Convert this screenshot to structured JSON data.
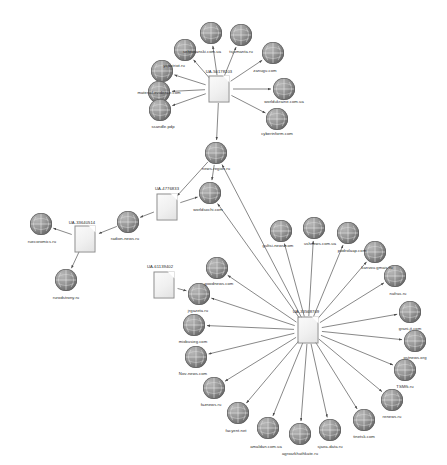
{
  "diagram": {
    "type": "link-analysis-graph",
    "background": "#ffffff",
    "edge_color": "#555555",
    "node_types": {
      "document": "ua-tracking-id-document-icon",
      "globe": "website-globe-icon"
    },
    "nodes": [
      {
        "id": "ua_top",
        "kind": "document",
        "label": "UA-50178103",
        "x": 219,
        "y": 89,
        "label_x": 219,
        "label_y": 69
      },
      {
        "id": "sehrosanski",
        "kind": "globe",
        "label": "sehrosanski.com.ua",
        "x": 185,
        "y": 50,
        "label_x": 202,
        "label_y": 49
      },
      {
        "id": "tsjumanta",
        "kind": "globe",
        "label": "tsjumanta.ru",
        "x": 241,
        "y": 35,
        "label_x": 241,
        "label_y": 49
      },
      {
        "id": "top_unlabeled",
        "kind": "globe",
        "label": "",
        "x": 211,
        "y": 33,
        "label_x": 211,
        "label_y": 24
      },
      {
        "id": "yapatriot",
        "kind": "globe",
        "label": "yapatriot.ru",
        "x": 162,
        "y": 71,
        "label_x": 174,
        "label_y": 63
      },
      {
        "id": "zanugu",
        "kind": "globe",
        "label": "zanugu.com",
        "x": 273,
        "y": 53,
        "label_x": 265,
        "label_y": 68
      },
      {
        "id": "material_ev",
        "kind": "globe",
        "label": "material-evidence.com",
        "x": 159,
        "y": 92,
        "label_x": 159,
        "label_y": 90
      },
      {
        "id": "worldukraine",
        "kind": "globe",
        "label": "worldukraine.com.ua",
        "x": 284,
        "y": 89,
        "label_x": 284,
        "label_y": 99
      },
      {
        "id": "ssandle",
        "kind": "globe",
        "label": "ssandle.pdp",
        "x": 160,
        "y": 110,
        "label_x": 163,
        "label_y": 124
      },
      {
        "id": "cyberinform",
        "kind": "globe",
        "label": "cyberinform.com",
        "x": 277,
        "y": 119,
        "label_x": 277,
        "label_y": 131
      },
      {
        "id": "news_region",
        "kind": "globe",
        "label": "news-region.ru",
        "x": 216,
        "y": 153,
        "label_x": 216,
        "label_y": 166
      },
      {
        "id": "ua_4776833",
        "kind": "document",
        "label": "UA-4776833",
        "x": 167,
        "y": 207,
        "label_x": 167,
        "label_y": 186
      },
      {
        "id": "worldsochi",
        "kind": "globe",
        "label": "worldsochi.com",
        "x": 210,
        "y": 193,
        "label_x": 208,
        "label_y": 207
      },
      {
        "id": "radion_news",
        "kind": "globe",
        "label": "radion-news.ru",
        "x": 128,
        "y": 222,
        "label_x": 125,
        "label_y": 236
      },
      {
        "id": "ua_33640514",
        "kind": "document",
        "label": "UA-33640514",
        "x": 85,
        "y": 239,
        "label_x": 82,
        "label_y": 220
      },
      {
        "id": "ruecoromics",
        "kind": "globe",
        "label": "ruecoromics.ru",
        "x": 41,
        "y": 224,
        "label_x": 42,
        "label_y": 239
      },
      {
        "id": "rurodstrony",
        "kind": "globe",
        "label": "rurodstrony.ru",
        "x": 66,
        "y": 280,
        "label_x": 66,
        "label_y": 295
      },
      {
        "id": "ua_61139402",
        "kind": "document",
        "label": "UA-61139402",
        "x": 164,
        "y": 285,
        "label_x": 160,
        "label_y": 264
      },
      {
        "id": "ua_hub",
        "kind": "document",
        "label": "UA-33568709",
        "x": 308,
        "y": 330,
        "label_x": 306,
        "label_y": 309
      },
      {
        "id": "gultsi",
        "kind": "globe",
        "label": "gultsi-news.com",
        "x": 281,
        "y": 231,
        "label_x": 278,
        "label_y": 243
      },
      {
        "id": "ushnews",
        "kind": "globe",
        "label": "ushnews.com.ua",
        "x": 314,
        "y": 228,
        "label_x": 320,
        "label_y": 241
      },
      {
        "id": "podrolaap",
        "kind": "globe",
        "label": "podrolaap.com",
        "x": 348,
        "y": 233,
        "label_x": 352,
        "label_y": 248
      },
      {
        "id": "kanvou",
        "kind": "globe",
        "label": "kanvou.gmais.ru",
        "x": 375,
        "y": 252,
        "label_x": 377,
        "label_y": 265
      },
      {
        "id": "nafras",
        "kind": "globe",
        "label": "nafras.ru",
        "x": 395,
        "y": 276,
        "label_x": 398,
        "label_y": 291
      },
      {
        "id": "granit",
        "kind": "globe",
        "label": "grani-jt.com",
        "x": 410,
        "y": 312,
        "label_x": 410,
        "label_y": 326
      },
      {
        "id": "ostnews",
        "kind": "globe",
        "label": "ostnews.org",
        "x": 415,
        "y": 341,
        "label_x": 415,
        "label_y": 355
      },
      {
        "id": "tsmfk",
        "kind": "globe",
        "label": "TSMfk.ru",
        "x": 405,
        "y": 370,
        "label_x": 405,
        "label_y": 384
      },
      {
        "id": "renews",
        "kind": "globe",
        "label": "renews.ru",
        "x": 392,
        "y": 400,
        "label_x": 392,
        "label_y": 414
      },
      {
        "id": "tinetsk",
        "kind": "globe",
        "label": "tinetsk.com",
        "x": 364,
        "y": 420,
        "label_x": 364,
        "label_y": 434
      },
      {
        "id": "sjaea_data",
        "kind": "globe",
        "label": "sjaea-data.ru",
        "x": 330,
        "y": 430,
        "label_x": 330,
        "label_y": 444
      },
      {
        "id": "agromarkt",
        "kind": "globe",
        "label": "agroarkhathkate.ru",
        "x": 300,
        "y": 434,
        "label_x": 300,
        "label_y": 451
      },
      {
        "id": "amaldan",
        "kind": "globe",
        "label": "amaldan.com.ua",
        "x": 268,
        "y": 428,
        "label_x": 266,
        "label_y": 444
      },
      {
        "id": "facyent",
        "kind": "globe",
        "label": "facyent.net",
        "x": 238,
        "y": 413,
        "label_x": 236,
        "label_y": 428
      },
      {
        "id": "faznews",
        "kind": "globe",
        "label": "faznews.ru",
        "x": 214,
        "y": 388,
        "label_x": 211,
        "label_y": 402
      },
      {
        "id": "nov_news",
        "kind": "globe",
        "label": "Nov-news.com",
        "x": 196,
        "y": 357,
        "label_x": 193,
        "label_y": 371
      },
      {
        "id": "mixbusieg",
        "kind": "globe",
        "label": "mixbusieg.com",
        "x": 194,
        "y": 325,
        "label_x": 193,
        "label_y": 339
      },
      {
        "id": "jrgazeta",
        "kind": "globe",
        "label": "jrgazeta.ru",
        "x": 199,
        "y": 294,
        "label_x": 198,
        "label_y": 308
      },
      {
        "id": "goodnews",
        "kind": "globe",
        "label": "goodnews.com",
        "x": 217,
        "y": 268,
        "label_x": 219,
        "label_y": 281
      }
    ],
    "edges": [
      {
        "from": "ua_top",
        "to": "top_unlabeled"
      },
      {
        "from": "ua_top",
        "to": "sehrosanski"
      },
      {
        "from": "ua_top",
        "to": "tsjumanta"
      },
      {
        "from": "ua_top",
        "to": "yapatriot"
      },
      {
        "from": "ua_top",
        "to": "zanugu"
      },
      {
        "from": "ua_top",
        "to": "material_ev"
      },
      {
        "from": "ua_top",
        "to": "worldukraine"
      },
      {
        "from": "ua_top",
        "to": "ssandle"
      },
      {
        "from": "ua_top",
        "to": "cyberinform"
      },
      {
        "from": "ua_top",
        "to": "news_region"
      },
      {
        "from": "news_region",
        "to": "ua_4776833"
      },
      {
        "from": "ua_4776833",
        "to": "worldsochi"
      },
      {
        "from": "ua_4776833",
        "to": "radion_news"
      },
      {
        "from": "radion_news",
        "to": "ua_33640514"
      },
      {
        "from": "ua_33640514",
        "to": "ruecoromics"
      },
      {
        "from": "ua_33640514",
        "to": "rurodstrony"
      },
      {
        "from": "ua_61139402",
        "to": "jrgazeta"
      },
      {
        "from": "news_region",
        "to": "worldsochi"
      },
      {
        "from": "ua_hub",
        "to": "worldsochi"
      },
      {
        "from": "ua_hub",
        "to": "news_region"
      },
      {
        "from": "ua_hub",
        "to": "gultsi"
      },
      {
        "from": "ua_hub",
        "to": "ushnews"
      },
      {
        "from": "ua_hub",
        "to": "podrolaap"
      },
      {
        "from": "ua_hub",
        "to": "kanvou"
      },
      {
        "from": "ua_hub",
        "to": "nafras"
      },
      {
        "from": "ua_hub",
        "to": "granit"
      },
      {
        "from": "ua_hub",
        "to": "ostnews"
      },
      {
        "from": "ua_hub",
        "to": "tsmfk"
      },
      {
        "from": "ua_hub",
        "to": "renews"
      },
      {
        "from": "ua_hub",
        "to": "tinetsk"
      },
      {
        "from": "ua_hub",
        "to": "sjaea_data"
      },
      {
        "from": "ua_hub",
        "to": "agromarkt"
      },
      {
        "from": "ua_hub",
        "to": "amaldan"
      },
      {
        "from": "ua_hub",
        "to": "facyent"
      },
      {
        "from": "ua_hub",
        "to": "faznews"
      },
      {
        "from": "ua_hub",
        "to": "nov_news"
      },
      {
        "from": "ua_hub",
        "to": "mixbusieg"
      },
      {
        "from": "ua_hub",
        "to": "jrgazeta"
      },
      {
        "from": "ua_hub",
        "to": "goodnews"
      }
    ]
  }
}
